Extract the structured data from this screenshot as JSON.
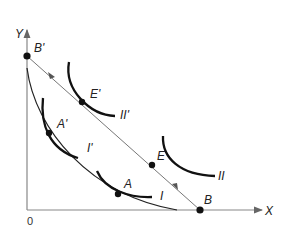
{
  "diagram": {
    "axes": {
      "x_label": "X",
      "y_label": "Y",
      "origin_label": "0"
    },
    "budget_line": {
      "start_label": "B'",
      "end_label": "B"
    },
    "points": [
      {
        "id": "A_prime",
        "label": "A'"
      },
      {
        "id": "E_prime",
        "label": "E'"
      },
      {
        "id": "E",
        "label": "E"
      },
      {
        "id": "A",
        "label": "A"
      }
    ],
    "indifference_curves": [
      {
        "id": "I_prime",
        "label": "I'"
      },
      {
        "id": "II_prime",
        "label": "II'"
      },
      {
        "id": "II",
        "label": "II"
      },
      {
        "id": "I",
        "label": "I"
      }
    ],
    "colors": {
      "axis": "#888888",
      "curve": "#111111",
      "line": "#777777"
    }
  }
}
